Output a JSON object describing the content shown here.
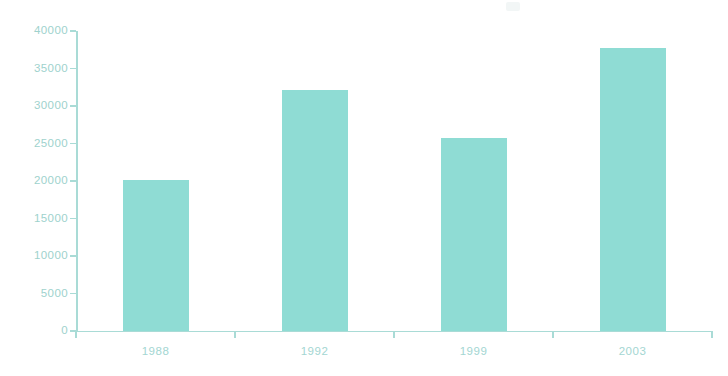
{
  "chart_data": {
    "type": "bar",
    "title": "",
    "subtitle": "",
    "xlabel": "",
    "ylabel": "",
    "categories": [
      "1988",
      "1992",
      "1999",
      "2003"
    ],
    "values": [
      20100,
      32100,
      25700,
      37700
    ],
    "series": [
      {
        "name": "",
        "values": [
          20100,
          32100,
          25700,
          37700
        ]
      }
    ],
    "ylim": [
      0,
      40000
    ],
    "yticks": [
      0,
      5000,
      10000,
      15000,
      20000,
      25000,
      30000,
      35000,
      40000
    ],
    "ytick_labels": [
      "0",
      "5000",
      "10000",
      "15000",
      "20000",
      "25000",
      "30000",
      "35000",
      "40000"
    ],
    "xtick_labels": [
      "1988",
      "1992",
      "1999",
      "2003"
    ],
    "grid": false,
    "legend": false,
    "legend_position": "none",
    "annotations": [],
    "colors": {
      "bar": "#8FDCD4",
      "axis": "#A9DBD6",
      "ytick_label": "#9ED2CD",
      "xtick_label": "#A3D6D2",
      "background": "#FFFFFF"
    }
  }
}
